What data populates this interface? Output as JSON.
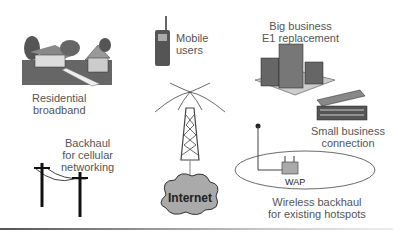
{
  "diagram": {
    "nodes": [
      {
        "id": "residential",
        "label_lines": [
          "Residential",
          "broadband"
        ]
      },
      {
        "id": "mobile",
        "label_lines": [
          "Mobile",
          "users"
        ]
      },
      {
        "id": "big_business",
        "label_lines": [
          "Big business",
          "E1 replacement"
        ]
      },
      {
        "id": "small_business",
        "label_lines": [
          "Small business",
          "connection"
        ]
      },
      {
        "id": "backhaul_cellular",
        "label_lines": [
          "Backhaul",
          "for cellular",
          "networking"
        ]
      },
      {
        "id": "internet",
        "label": "Internet"
      },
      {
        "id": "wap",
        "label": "WAP"
      },
      {
        "id": "wireless_backhaul",
        "label_lines": [
          "Wireless backhaul",
          "for existing hotspots"
        ]
      }
    ],
    "center": "tower",
    "tower_link": "internet"
  }
}
